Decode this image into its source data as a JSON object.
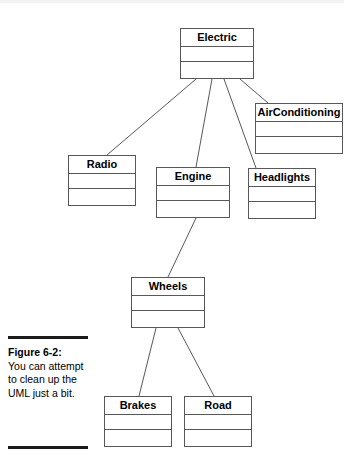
{
  "figure": {
    "caption_label": "Figure 6-2:",
    "caption_body": "You can attempt to clean up the UML just a bit."
  },
  "diagram": {
    "type": "uml-class-diagram",
    "classes": [
      {
        "id": "electric",
        "name": "Electric",
        "x": 180,
        "y": 28,
        "w": 74,
        "h": 51
      },
      {
        "id": "airconditioning",
        "name": "AirConditioning",
        "x": 255,
        "y": 103,
        "w": 88,
        "h": 51
      },
      {
        "id": "radio",
        "name": "Radio",
        "x": 68,
        "y": 155,
        "w": 68,
        "h": 51
      },
      {
        "id": "engine",
        "name": "Engine",
        "x": 156,
        "y": 167,
        "w": 74,
        "h": 51
      },
      {
        "id": "headlights",
        "name": "Headlights",
        "x": 248,
        "y": 168,
        "w": 68,
        "h": 51
      },
      {
        "id": "wheels",
        "name": "Wheels",
        "x": 131,
        "y": 277,
        "w": 74,
        "h": 51
      },
      {
        "id": "brakes",
        "name": "Brakes",
        "x": 104,
        "y": 396,
        "w": 68,
        "h": 51
      },
      {
        "id": "road",
        "name": "Road",
        "x": 184,
        "y": 396,
        "w": 68,
        "h": 51
      }
    ],
    "connections": [
      {
        "from": "electric",
        "to": "radio",
        "x1": 196,
        "y1": 79,
        "x2": 107,
        "y2": 155
      },
      {
        "from": "electric",
        "to": "engine",
        "x1": 212,
        "y1": 79,
        "x2": 196,
        "y2": 167
      },
      {
        "from": "electric",
        "to": "headlights",
        "x1": 224,
        "y1": 79,
        "x2": 256,
        "y2": 168
      },
      {
        "from": "electric",
        "to": "airconditioning",
        "x1": 240,
        "y1": 79,
        "x2": 268,
        "y2": 103
      },
      {
        "from": "engine",
        "to": "wheels",
        "x1": 196,
        "y1": 218,
        "x2": 168,
        "y2": 277
      },
      {
        "from": "wheels",
        "to": "brakes",
        "x1": 156,
        "y1": 328,
        "x2": 139,
        "y2": 396
      },
      {
        "from": "wheels",
        "to": "road",
        "x1": 178,
        "y1": 328,
        "x2": 214,
        "y2": 396
      }
    ],
    "line_color": "#58585a",
    "border_color": "#58585a"
  }
}
